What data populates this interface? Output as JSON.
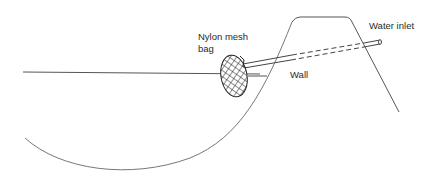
{
  "diagram": {
    "labels": {
      "bag_line1": "Nylon mesh",
      "bag_line2": "bag",
      "wall": "Wall",
      "water_inlet": "Water inlet"
    },
    "colors": {
      "line": "#555555",
      "text": "#2a2a2a",
      "background": "#ffffff"
    }
  }
}
